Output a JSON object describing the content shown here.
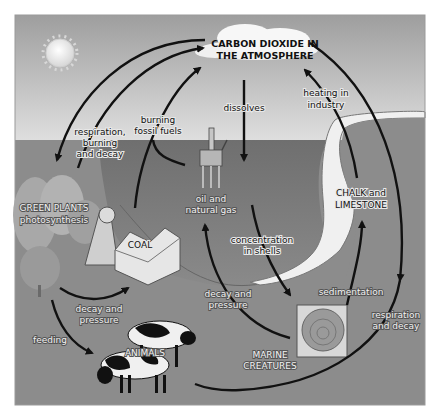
{
  "diagram": {
    "title_line1": "CARBON DIOXIDE IN",
    "title_line2": "THE ATMOSPHERE",
    "labels": {
      "respiration_1": "respiration,",
      "respiration_2": "burning",
      "respiration_3": "and decay",
      "burning_1": "burning",
      "burning_2": "fossil fuels",
      "dissolves": "dissolves",
      "heating_1": "heating in",
      "heating_2": "industry",
      "green_plants_1": "GREEN PLANTS",
      "green_plants_2": "photosynthesis",
      "coal": "COAL",
      "oil_1": "oil and",
      "oil_2": "natural gas",
      "chalk_1": "CHALK and",
      "chalk_2": "LIMESTONE",
      "concentration_1": "concentration",
      "concentration_2": "in shells",
      "sedimentation": "sedimentation",
      "decay_pressure_left_1": "decay and",
      "decay_pressure_left_2": "pressure",
      "decay_pressure_mid_1": "decay and",
      "decay_pressure_mid_2": "pressure",
      "respiration_decay_1": "respiration",
      "respiration_decay_2": "and decay",
      "feeding": "feeding",
      "animals": "ANIMALS",
      "marine_1": "MARINE",
      "marine_2": "CREATURES"
    }
  }
}
